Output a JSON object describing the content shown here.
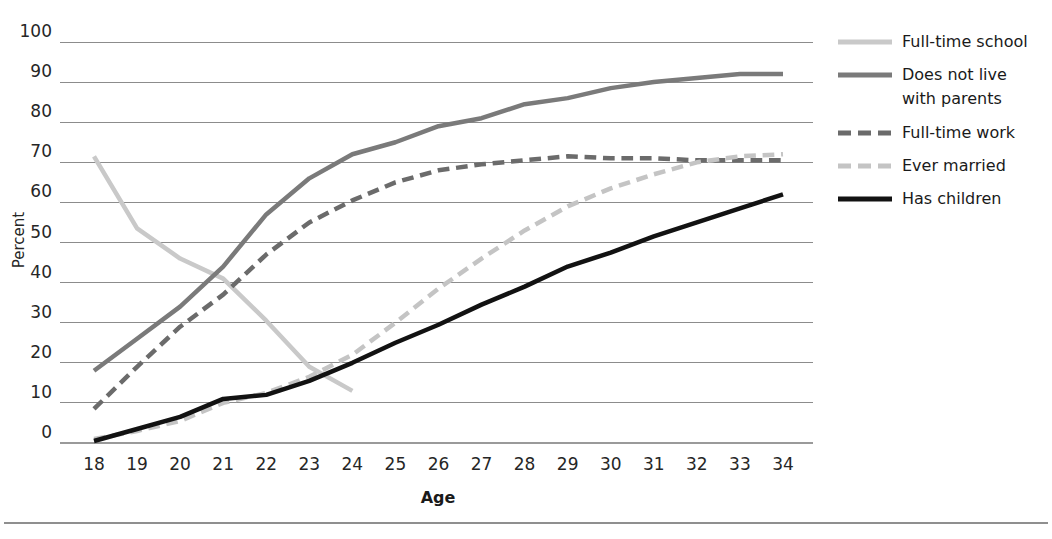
{
  "chart_data": {
    "type": "line",
    "title": "",
    "xlabel": "Age",
    "ylabel": "Percent",
    "xlim": [
      18,
      34
    ],
    "ylim": [
      0,
      100
    ],
    "grid": true,
    "legend_position": "right",
    "x": [
      18,
      19,
      20,
      21,
      22,
      23,
      24,
      25,
      26,
      27,
      28,
      29,
      30,
      31,
      32,
      33,
      34
    ],
    "xticklabels": [
      "18",
      "19",
      "20",
      "21",
      "22",
      "23",
      "24",
      "25",
      "26",
      "27",
      "28",
      "29",
      "30",
      "31",
      "32",
      "33",
      "34"
    ],
    "yticks": [
      0,
      10,
      20,
      30,
      40,
      50,
      60,
      70,
      80,
      90,
      100
    ],
    "yticklabels": [
      "0",
      "10",
      "20",
      "30",
      "40",
      "50",
      "60",
      "70",
      "80",
      "90",
      "100"
    ],
    "series": [
      {
        "name": "Full-time school",
        "color": "#c9c9c9",
        "style": "solid",
        "width": 4.5,
        "x": [
          18,
          19,
          20,
          21,
          22,
          23,
          24
        ],
        "values": [
          71.5,
          53.5,
          46.0,
          41.0,
          30.5,
          19.0,
          13.0
        ]
      },
      {
        "name": "Does not live with parents",
        "color": "#7a7a7a",
        "style": "solid",
        "width": 4.5,
        "x": [
          18,
          19,
          20,
          21,
          22,
          23,
          24,
          25,
          26,
          27,
          28,
          29,
          30,
          31,
          32,
          33,
          34
        ],
        "values": [
          18.0,
          26.0,
          34.0,
          44.0,
          57.0,
          66.0,
          72.0,
          75.0,
          79.0,
          81.0,
          84.5,
          86.0,
          88.5,
          90.0,
          91.0,
          92.0,
          92.0
        ]
      },
      {
        "name": "Full-time work",
        "color": "#6b6b6b",
        "style": "dashed",
        "width": 4.5,
        "x": [
          18,
          19,
          20,
          21,
          22,
          23,
          24,
          25,
          26,
          27,
          28,
          29,
          30,
          31,
          32,
          33,
          34
        ],
        "values": [
          8.5,
          19.0,
          29.0,
          37.0,
          47.0,
          55.0,
          60.5,
          65.0,
          68.0,
          69.5,
          70.5,
          71.5,
          71.0,
          71.0,
          70.5,
          70.5,
          70.5
        ]
      },
      {
        "name": "Ever married",
        "color": "#c4c4c4",
        "style": "dashed",
        "width": 4.5,
        "x": [
          18,
          19,
          20,
          21,
          22,
          23,
          24,
          25,
          26,
          27,
          28,
          29,
          30,
          31,
          32,
          33,
          34
        ],
        "values": [
          1.0,
          3.0,
          5.5,
          10.0,
          12.5,
          16.5,
          22.0,
          30.0,
          38.5,
          46.0,
          53.0,
          59.0,
          63.5,
          67.0,
          70.0,
          71.5,
          72.0
        ]
      },
      {
        "name": "Has children",
        "color": "#121212",
        "style": "solid",
        "width": 4.5,
        "x": [
          18,
          19,
          20,
          21,
          22,
          23,
          24,
          25,
          26,
          27,
          28,
          29,
          30,
          31,
          32,
          33,
          34
        ],
        "values": [
          0.5,
          3.5,
          6.5,
          11.0,
          12.0,
          15.5,
          20.0,
          25.0,
          29.5,
          34.5,
          39.0,
          44.0,
          47.5,
          51.5,
          55.0,
          58.5,
          62.0
        ]
      }
    ],
    "legend": [
      {
        "label": "Full-time school",
        "color": "#c9c9c9",
        "style": "solid"
      },
      {
        "label": "Does not live with parents",
        "color": "#7a7a7a",
        "style": "solid"
      },
      {
        "label": "Full-time work",
        "color": "#6b6b6b",
        "style": "dashed"
      },
      {
        "label": "Ever married",
        "color": "#c4c4c4",
        "style": "dashed"
      },
      {
        "label": "Has children",
        "color": "#121212",
        "style": "solid"
      }
    ]
  },
  "legend_text": {
    "item0": "Full-time school",
    "item1_line1": "Does not live",
    "item1_line2": "with parents",
    "item2": "Full-time work",
    "item3": "Ever married",
    "item4": "Has children"
  },
  "axis": {
    "ylabel": "Percent",
    "xlabel": "Age"
  }
}
